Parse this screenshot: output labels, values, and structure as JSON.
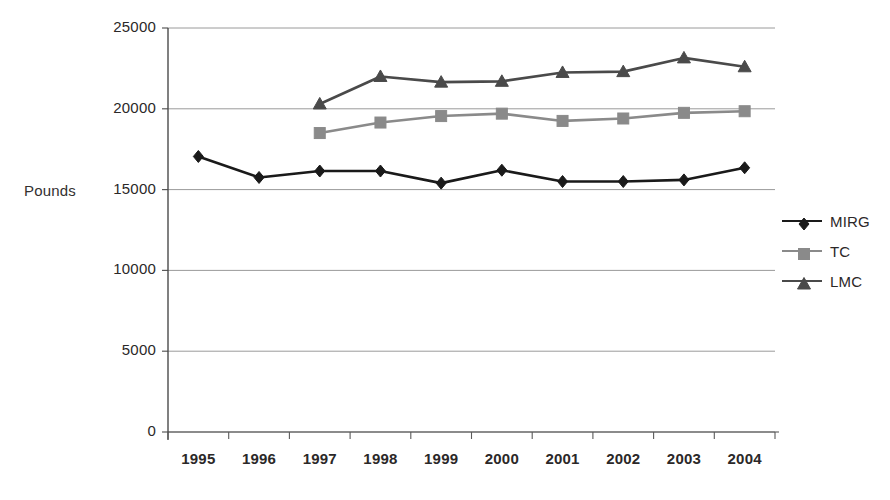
{
  "chart_data": {
    "type": "line",
    "title": "",
    "xlabel": "",
    "ylabel": "Pounds",
    "categories": [
      "1995",
      "1996",
      "1997",
      "1998",
      "1999",
      "2000",
      "2001",
      "2002",
      "2003",
      "2004"
    ],
    "ylim": [
      0,
      25000
    ],
    "y_ticks": [
      0,
      5000,
      10000,
      15000,
      20000,
      25000
    ],
    "y_tick_labels": [
      "0",
      "5000",
      "10000",
      "15000",
      "20000",
      "25000"
    ],
    "grid": "horizontal",
    "legend_position": "right",
    "series": [
      {
        "name": "MIRG",
        "marker": "diamond",
        "color": "#1a1a1a",
        "values": [
          17050,
          15750,
          16150,
          16150,
          15400,
          16200,
          15500,
          15500,
          15600,
          16350
        ]
      },
      {
        "name": "TC",
        "marker": "square",
        "color": "#8a8a8a",
        "values": [
          null,
          null,
          18500,
          19150,
          19550,
          19700,
          19250,
          19400,
          19750,
          19850
        ]
      },
      {
        "name": "LMC",
        "marker": "triangle",
        "color": "#4a4a4a",
        "values": [
          null,
          null,
          20300,
          22000,
          21650,
          21700,
          22250,
          22300,
          23150,
          22600
        ]
      }
    ]
  },
  "axis": {
    "y_title": "Pounds"
  },
  "legend": {
    "items": [
      {
        "label": "MIRG"
      },
      {
        "label": "TC"
      },
      {
        "label": "LMC"
      }
    ]
  }
}
